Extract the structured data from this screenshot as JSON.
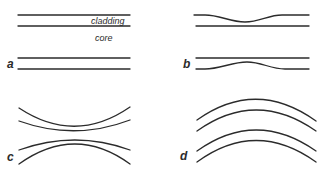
{
  "figure": {
    "panels": [
      {
        "id": "a",
        "label": "a",
        "type": "straight",
        "annotations": {
          "cladding": "cladding",
          "core": "core"
        }
      },
      {
        "id": "b",
        "label": "b",
        "type": "local-constriction"
      },
      {
        "id": "c",
        "label": "c",
        "type": "taper-narrowing"
      },
      {
        "id": "d",
        "label": "d",
        "type": "bend"
      }
    ],
    "stroke_color": "#2b2b2b"
  }
}
